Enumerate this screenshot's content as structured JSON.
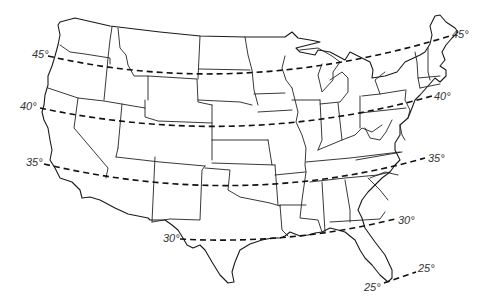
{
  "map": {
    "subject": "Contiguous United States outline with state boundaries",
    "background_color": "#ffffff",
    "line_color": "#1a1a1a",
    "latitude_lines": [
      {
        "id": "lat-45",
        "label_left": "45°",
        "label_right": "45°",
        "degrees": 45
      },
      {
        "id": "lat-40",
        "label_left": "40°",
        "label_right": "40°",
        "degrees": 40
      },
      {
        "id": "lat-35",
        "label_left": "35°",
        "label_right": "35°",
        "degrees": 35
      },
      {
        "id": "lat-30",
        "label_left": "30°",
        "label_right": "30°",
        "degrees": 30
      },
      {
        "id": "lat-25",
        "label_left": "25°",
        "label_right": "25°",
        "degrees": 25
      }
    ]
  }
}
